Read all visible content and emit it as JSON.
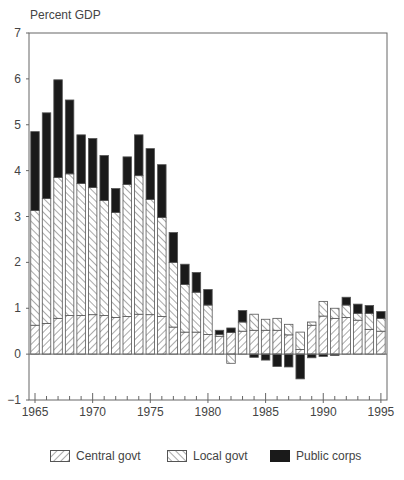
{
  "chart_data": {
    "type": "bar",
    "stacked": true,
    "title": "",
    "ylabel": "Percent GDP",
    "xlabel": "",
    "ylim": [
      -1,
      7
    ],
    "yticks": [
      -1,
      0,
      1,
      2,
      3,
      4,
      5,
      6,
      7
    ],
    "xticks": [
      1965,
      1970,
      1975,
      1980,
      1985,
      1990,
      1995
    ],
    "grid": false,
    "legend_position": "bottom",
    "categories": [
      1965,
      1966,
      1967,
      1968,
      1969,
      1970,
      1971,
      1972,
      1973,
      1974,
      1975,
      1976,
      1977,
      1978,
      1979,
      1980,
      1981,
      1982,
      1983,
      1984,
      1985,
      1986,
      1987,
      1988,
      1989,
      1990,
      1991,
      1992,
      1993,
      1994,
      1995
    ],
    "series": [
      {
        "name": "Central govt",
        "pattern": "hatch-forward",
        "values": [
          0.63,
          0.67,
          0.78,
          0.84,
          0.84,
          0.86,
          0.84,
          0.8,
          0.82,
          0.87,
          0.86,
          0.82,
          0.59,
          0.48,
          0.48,
          0.43,
          0.39,
          0.47,
          0.5,
          0.52,
          0.52,
          0.52,
          0.42,
          0.1,
          0.63,
          0.83,
          0.78,
          0.8,
          0.74,
          0.54,
          0.5
        ]
      },
      {
        "name": "Local govt",
        "pattern": "hatch-backward",
        "values": [
          2.5,
          2.72,
          3.07,
          3.09,
          2.88,
          2.77,
          2.51,
          2.29,
          2.88,
          3.02,
          2.51,
          2.16,
          1.41,
          1.04,
          0.87,
          0.64,
          0.04,
          -0.2,
          0.2,
          0.35,
          0.24,
          0.26,
          0.23,
          0.38,
          0.07,
          0.32,
          0.22,
          0.27,
          0.15,
          0.35,
          0.28
        ]
      },
      {
        "name": "Public corps",
        "pattern": "solid-black",
        "values": [
          1.72,
          1.87,
          2.13,
          1.61,
          1.06,
          1.07,
          0.98,
          0.52,
          0.6,
          0.89,
          1.11,
          1.15,
          0.65,
          0.44,
          0.43,
          0.34,
          0.09,
          0.1,
          0.25,
          -0.07,
          -0.13,
          -0.27,
          -0.28,
          -0.54,
          -0.08,
          -0.05,
          -0.03,
          0.17,
          0.2,
          0.17,
          0.15
        ]
      }
    ]
  },
  "axis": {
    "y_title": "Percent GDP",
    "y_tick_labels": [
      "7",
      "6",
      "5",
      "4",
      "3",
      "2",
      "1",
      "0",
      "−1"
    ],
    "x_tick_labels": [
      "1965",
      "1970",
      "1975",
      "1980",
      "1985",
      "1990",
      "1995"
    ]
  },
  "legend": {
    "items": [
      {
        "label": "Central govt",
        "pattern": "hatch-forward"
      },
      {
        "label": "Local govt",
        "pattern": "hatch-backward"
      },
      {
        "label": "Public corps",
        "pattern": "solid-black"
      }
    ]
  },
  "colors": {
    "axis": "#666666",
    "bar_outline": "#555555",
    "hatch": "#555555",
    "public_corps": "#1a1a1a",
    "text": "#444444"
  }
}
